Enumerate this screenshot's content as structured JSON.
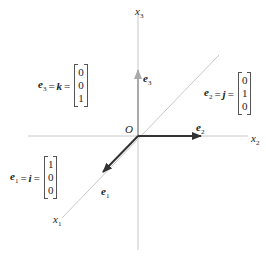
{
  "axes": {
    "x1": {
      "name": "x",
      "sub": "1"
    },
    "x2": {
      "name": "x",
      "sub": "2"
    },
    "x3": {
      "name": "x",
      "sub": "3"
    },
    "origin": "O"
  },
  "vectors": {
    "e1": {
      "name": "e",
      "sub": "1",
      "alias": "i",
      "components": [
        "1",
        "0",
        "0"
      ],
      "color": "#333333"
    },
    "e2": {
      "name": "e",
      "sub": "2",
      "alias": "j",
      "components": [
        "0",
        "1",
        "0"
      ],
      "color": "#333333"
    },
    "e3": {
      "name": "e",
      "sub": "3",
      "alias": "k",
      "components": [
        "0",
        "0",
        "1"
      ],
      "color": "#aaaaaa"
    }
  },
  "symbols": {
    "equals": "="
  },
  "colors": {
    "axis": "#c8c8c8",
    "dark_arrow": "#333333",
    "light_arrow": "#aaaaaa"
  }
}
